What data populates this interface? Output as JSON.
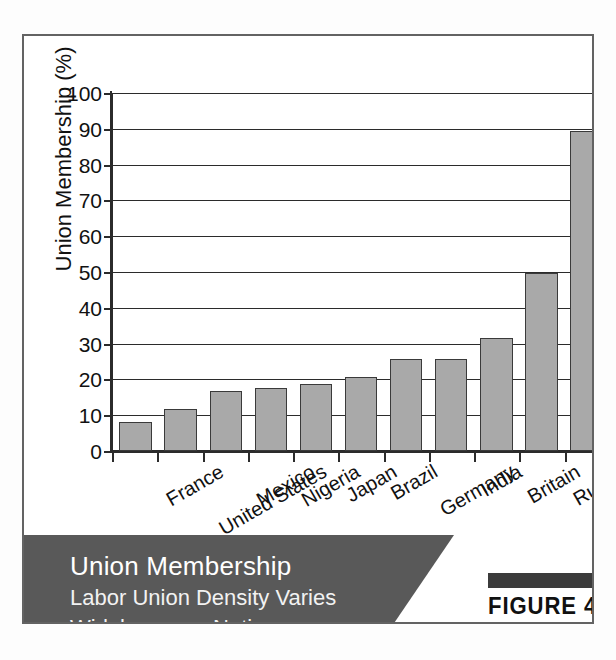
{
  "figure": {
    "number_label": "FIGURE 4.1",
    "caption_title": "Union Membership",
    "caption_subtitle_line1": "Labor Union Density Varies",
    "caption_subtitle_line2": "Widely across Nations",
    "banner_color": "#595959",
    "bar_fill_color": "#a9a9a9",
    "bar_border_color": "#3a3a3a",
    "axis_color": "#2b2b2b"
  },
  "chart_data": {
    "type": "bar",
    "title": "Union Membership",
    "subtitle": "Labor Union Density Varies Widely across Nations",
    "xlabel": "",
    "ylabel": "Union Membership (%)",
    "ylim": [
      0,
      100
    ],
    "ytick_step": 10,
    "yticks": [
      0,
      10,
      20,
      30,
      40,
      50,
      60,
      70,
      80,
      90,
      100
    ],
    "ytick_labels": [
      "0",
      "10",
      "20",
      "30",
      "40",
      "50",
      "60",
      "70",
      "80",
      "90",
      "100"
    ],
    "grid": true,
    "legend": false,
    "orientation": "vertical",
    "categories": [
      "France",
      "United States",
      "Mexico",
      "Nigeria",
      "Japan",
      "Brazil",
      "Germany",
      "India",
      "Britain",
      "Russia",
      "China"
    ],
    "values": [
      8,
      11.7,
      16.8,
      17.7,
      18.7,
      20.7,
      25.8,
      25.7,
      31.7,
      49.7,
      89.5
    ]
  }
}
